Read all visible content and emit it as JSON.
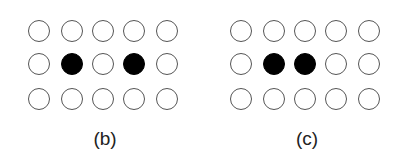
{
  "panels": [
    {
      "label": "(b)",
      "rows": 3,
      "cols": 5,
      "filled": [
        [
          1,
          1
        ],
        [
          1,
          3
        ]
      ]
    },
    {
      "label": "(c)",
      "rows": 3,
      "cols": 5,
      "filled": [
        [
          1,
          1
        ],
        [
          1,
          2
        ]
      ]
    }
  ],
  "colors": {
    "filled": "#000000",
    "outline": "#555555",
    "background": "#ffffff"
  }
}
